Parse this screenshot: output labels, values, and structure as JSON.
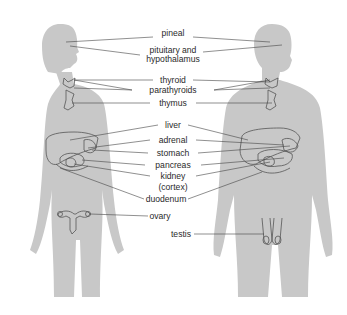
{
  "figure": {
    "silhouette_color": "#c8c8c8",
    "outline_color": "#555555",
    "leader_color": "#444444",
    "subjects": [
      "female",
      "male"
    ]
  },
  "labels": [
    {
      "id": "pineal",
      "text": "pineal",
      "x": 173,
      "y": 33
    },
    {
      "id": "pituitary",
      "text": "pituitary and",
      "x": 173,
      "y": 45
    },
    {
      "id": "hypothalamus",
      "text": "hypothalamus",
      "x": 173,
      "y": 55
    },
    {
      "id": "thyroid",
      "text": "thyroid",
      "x": 173,
      "y": 76
    },
    {
      "id": "parathyroids",
      "text": "parathyroids",
      "x": 173,
      "y": 86
    },
    {
      "id": "thymus",
      "text": "thymus",
      "x": 173,
      "y": 99
    },
    {
      "id": "liver",
      "text": "liver",
      "x": 173,
      "y": 121
    },
    {
      "id": "adrenal",
      "text": "adrenal",
      "x": 173,
      "y": 136
    },
    {
      "id": "stomach",
      "text": "stomach",
      "x": 173,
      "y": 149
    },
    {
      "id": "pancreas",
      "text": "pancreas",
      "x": 173,
      "y": 161
    },
    {
      "id": "kidney",
      "text": "kidney",
      "x": 173,
      "y": 172
    },
    {
      "id": "cortex",
      "text": "(cortex)",
      "x": 173,
      "y": 183
    },
    {
      "id": "duodenum",
      "text": "duodenum",
      "x": 166,
      "y": 195
    },
    {
      "id": "ovary",
      "text": "ovary",
      "x": 160,
      "y": 212
    },
    {
      "id": "testis",
      "text": "testis",
      "x": 181,
      "y": 230
    }
  ]
}
